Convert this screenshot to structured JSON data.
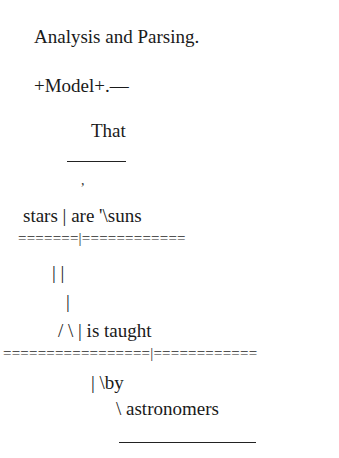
{
  "document": {
    "heading": "Analysis and Parsing.",
    "model_line": "+Model+.—",
    "diagram": {
      "subject_modifier": "That",
      "comma_mark": ",",
      "clause_line": "stars | are '\\suns",
      "clause_baseline": "=======|============",
      "double_bar": "| |",
      "single_bar": "|",
      "predicate_line": "/ \\ | is taught",
      "main_baseline": "=================|============",
      "by_line": "| \\by",
      "object_line": "\\ astronomers"
    }
  }
}
